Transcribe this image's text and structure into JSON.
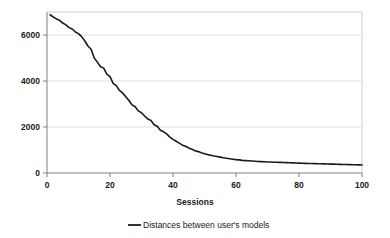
{
  "chart_data": {
    "type": "line",
    "title": "",
    "xlabel": "Sessions",
    "ylabel": "",
    "xlim": [
      0,
      100
    ],
    "ylim": [
      0,
      7000
    ],
    "grid": true,
    "legend_position": "bottom",
    "x_ticks": [
      "0",
      "20",
      "40",
      "60",
      "80",
      "100"
    ],
    "x_tick_values": [
      0,
      20,
      40,
      60,
      80,
      100
    ],
    "y_ticks": [
      "0",
      "2000",
      "4000",
      "6000"
    ],
    "y_tick_values": [
      0,
      2000,
      4000,
      6000
    ],
    "series": [
      {
        "name": "Distances between user's models",
        "color": "#1a1a1a",
        "x": [
          1,
          2,
          3,
          4,
          5,
          6,
          7,
          8,
          9,
          10,
          11,
          12,
          13,
          14,
          15,
          16,
          17,
          18,
          19,
          20,
          21,
          22,
          23,
          24,
          25,
          26,
          27,
          28,
          29,
          30,
          31,
          32,
          33,
          34,
          35,
          36,
          37,
          38,
          39,
          40,
          41,
          42,
          43,
          44,
          45,
          46,
          47,
          48,
          49,
          50,
          51,
          52,
          53,
          54,
          55,
          56,
          57,
          58,
          59,
          60,
          61,
          62,
          63,
          64,
          65,
          66,
          67,
          68,
          69,
          70,
          71,
          72,
          73,
          74,
          75,
          76,
          77,
          78,
          79,
          80,
          81,
          82,
          83,
          84,
          85,
          86,
          87,
          88,
          89,
          90,
          91,
          92,
          93,
          94,
          95,
          96,
          97,
          98,
          99,
          100
        ],
        "values": [
          6880,
          6780,
          6700,
          6640,
          6520,
          6440,
          6320,
          6260,
          6130,
          6060,
          5930,
          5740,
          5520,
          5380,
          5000,
          4820,
          4620,
          4560,
          4300,
          4190,
          3900,
          3800,
          3590,
          3480,
          3320,
          3150,
          2960,
          2880,
          2700,
          2620,
          2480,
          2350,
          2280,
          2100,
          2030,
          1860,
          1790,
          1700,
          1560,
          1460,
          1380,
          1300,
          1210,
          1160,
          1090,
          1030,
          970,
          930,
          880,
          840,
          800,
          770,
          740,
          720,
          690,
          660,
          640,
          620,
          600,
          580,
          570,
          550,
          540,
          530,
          520,
          510,
          500,
          495,
          490,
          480,
          475,
          470,
          465,
          460,
          455,
          450,
          445,
          440,
          435,
          430,
          425,
          420,
          415,
          412,
          408,
          404,
          400,
          396,
          392,
          388,
          384,
          380,
          376,
          372,
          368,
          364,
          360,
          356,
          352,
          348
        ]
      }
    ]
  },
  "legend": {
    "entries": [
      {
        "label": "Distances between user's models",
        "color": "#1a1a1a"
      }
    ]
  },
  "axes": {
    "x_title": "Sessions"
  }
}
